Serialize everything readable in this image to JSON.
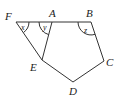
{
  "diagram": {
    "type": "geometry",
    "points": {
      "F": {
        "label": "F",
        "x": 16,
        "y": 22
      },
      "A": {
        "label": "A",
        "x": 52,
        "y": 22
      },
      "B": {
        "label": "B",
        "x": 91,
        "y": 22
      },
      "C": {
        "label": "C",
        "x": 104,
        "y": 61
      },
      "D": {
        "label": "D",
        "x": 73,
        "y": 82
      },
      "E": {
        "label": "E",
        "x": 42,
        "y": 60
      }
    },
    "segments": [
      "FA",
      "AB",
      "BC",
      "CD",
      "DE",
      "EF",
      "AE"
    ],
    "angles": [
      {
        "label": "x",
        "vertex": "F"
      },
      {
        "label": "y",
        "vertex": "A"
      },
      {
        "label": "z",
        "vertex": "B"
      }
    ]
  }
}
